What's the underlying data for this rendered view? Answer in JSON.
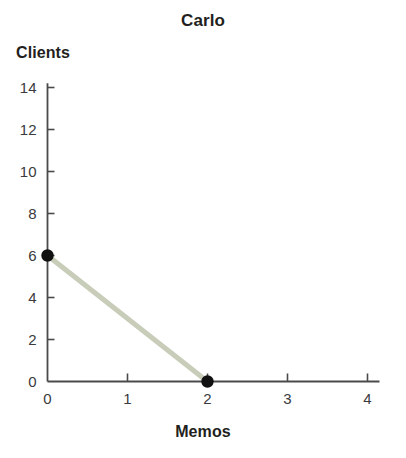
{
  "chart_data": {
    "type": "line",
    "title": "Carlo",
    "xlabel": "Memos",
    "ylabel": "Clients",
    "xlim": [
      0,
      4.15
    ],
    "ylim": [
      0,
      14.2
    ],
    "xticks": [
      "0",
      "1",
      "2",
      "3",
      "4"
    ],
    "xtick_values": [
      0,
      1,
      2,
      3,
      4
    ],
    "yticks": [
      "0",
      "2",
      "4",
      "6",
      "8",
      "10",
      "12",
      "14"
    ],
    "ytick_values": [
      0,
      2,
      4,
      6,
      8,
      10,
      12,
      14
    ],
    "grid": false,
    "legend": null,
    "series": [
      {
        "name": "Production possibilities frontier",
        "color": "#c7cdb9",
        "marker_color": "#111111",
        "x": [
          0,
          2
        ],
        "values": [
          6,
          0
        ],
        "points": [
          {
            "x": 0,
            "y": 6
          },
          {
            "x": 2,
            "y": 0
          }
        ]
      }
    ]
  },
  "axis": {
    "line_color": "#4a4a4a",
    "tick_color": "#4a4a4a"
  },
  "background": "#ffffff"
}
